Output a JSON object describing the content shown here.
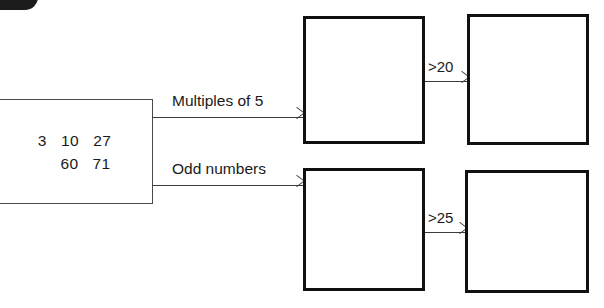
{
  "diagram": {
    "badge": {
      "name": "question-number-badge",
      "visible_fragment": true
    },
    "input_box": {
      "name": "number-set-box",
      "rows": [
        "3   10   27",
        "60   71"
      ]
    },
    "branch_arrows": [
      {
        "label": "Multiples of 5"
      },
      {
        "label": "Odd numbers"
      }
    ],
    "filter_arrows": [
      {
        "label": ">20"
      },
      {
        "label": ">25"
      }
    ],
    "result_boxes": [
      {
        "name": "box-top-left",
        "value": ""
      },
      {
        "name": "box-top-right",
        "value": ""
      },
      {
        "name": "box-bottom-left",
        "value": ""
      },
      {
        "name": "box-bottom-right",
        "value": ""
      }
    ],
    "colors": {
      "box_outline": "#111111",
      "thin_line": "#3c3c3c",
      "text": "#1a1a1a",
      "background": "#ffffff"
    }
  }
}
